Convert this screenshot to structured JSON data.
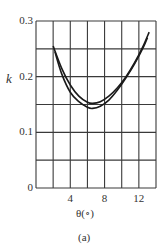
{
  "chart_data": {
    "type": "line",
    "title": "",
    "xlabel": "θ(∘)",
    "ylabel": "k",
    "caption": "(a)",
    "xlim": [
      0,
      14
    ],
    "ylim": [
      0,
      0.3
    ],
    "grid": true,
    "x_gridlines": [
      0,
      2,
      4,
      6,
      8,
      10,
      12,
      14
    ],
    "y_gridlines": [
      0,
      0.05,
      0.1,
      0.15,
      0.2,
      0.25,
      0.3
    ],
    "x_ticks": [
      {
        "value": 4,
        "label": "4"
      },
      {
        "value": 8,
        "label": "8"
      },
      {
        "value": 12,
        "label": "12"
      }
    ],
    "y_ticks": [
      {
        "value": 0,
        "label": "0"
      },
      {
        "value": 0.1,
        "label": "0.1"
      },
      {
        "value": 0.2,
        "label": "0.2"
      },
      {
        "value": 0.3,
        "label": "0.3"
      }
    ],
    "series": [
      {
        "name": "upper curve",
        "x": [
          2.0,
          3.0,
          4.0,
          5.0,
          6.0,
          6.6,
          7.5,
          8.5,
          9.5,
          10.5,
          11.5,
          12.5,
          13.2
        ],
        "y": [
          0.255,
          0.215,
          0.185,
          0.165,
          0.154,
          0.152,
          0.155,
          0.165,
          0.18,
          0.2,
          0.225,
          0.255,
          0.28
        ]
      },
      {
        "name": "lower curve",
        "x": [
          2.2,
          3.0,
          4.0,
          5.0,
          6.0,
          6.6,
          7.5,
          8.5,
          9.5,
          10.5,
          11.5,
          12.5,
          13.0
        ],
        "y": [
          0.245,
          0.205,
          0.172,
          0.155,
          0.145,
          0.143,
          0.147,
          0.158,
          0.176,
          0.198,
          0.223,
          0.252,
          0.27
        ]
      }
    ]
  },
  "labels": {
    "ylabel": "k",
    "xlabel": "θ(∘)",
    "caption": "(a)"
  }
}
